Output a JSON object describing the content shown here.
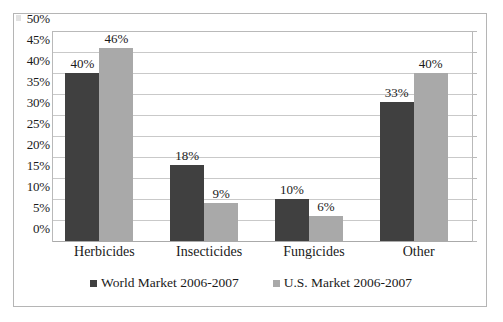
{
  "chart_data": {
    "type": "bar",
    "title": "",
    "subtitle": "",
    "xlabel": "",
    "ylabel": "",
    "categories": [
      "Herbicides",
      "Insecticides",
      "Fungicides",
      "Other"
    ],
    "series": [
      {
        "name": "World Market 2006-2007",
        "color": "#404040",
        "values": [
          40,
          18,
          10,
          33
        ],
        "labels": [
          "40%",
          "18%",
          "10%",
          "33%"
        ]
      },
      {
        "name": "U.S. Market 2006-2007",
        "color": "#a9a9a9",
        "values": [
          46,
          9,
          6,
          40
        ],
        "labels": [
          "46%",
          "9%",
          "6%",
          "40%"
        ]
      }
    ],
    "ylim": [
      0,
      50
    ],
    "ytick_values": [
      0,
      5,
      10,
      15,
      20,
      25,
      30,
      35,
      40,
      45,
      50
    ],
    "ytick_labels": [
      "0%",
      "5%",
      "10%",
      "15%",
      "20%",
      "25%",
      "30%",
      "35%",
      "40%",
      "45%",
      "50%"
    ],
    "grid": true,
    "legend_position": "bottom",
    "value_labels_shown": true
  },
  "legend": {
    "items": [
      {
        "label": "World Market 2006-2007",
        "swatch": "legend-swatch-dark"
      },
      {
        "label": "U.S. Market 2006-2007",
        "swatch": "legend-swatch-light"
      }
    ]
  },
  "colors": {
    "series_world": "#404040",
    "series_us": "#a9a9a9",
    "gridline": "#c9c9c9",
    "frame_border": "#b5b5b5",
    "background": "#ffffff"
  }
}
